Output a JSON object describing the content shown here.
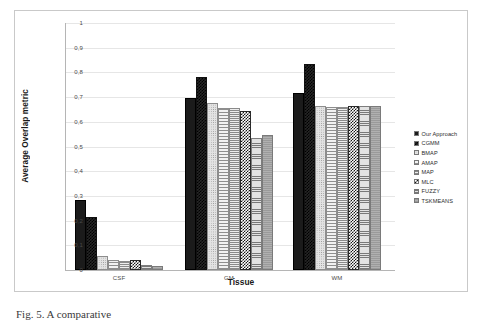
{
  "figure": {
    "caption": "Fig. 5.  A comparative",
    "background_color": "#ffffff",
    "frame_color": "#c9c9c9"
  },
  "chart_data": {
    "type": "bar",
    "title": "",
    "xlabel": "Tissue",
    "ylabel": "Average Overlap metric",
    "categories": [
      "CSF",
      "GM",
      "WM"
    ],
    "ylim": [
      0,
      1
    ],
    "yticks": [
      "0",
      "0,1",
      "0,2",
      "0,3",
      "0,4",
      "0,5",
      "0,6",
      "0,7",
      "0,8",
      "0,9",
      "1"
    ],
    "ytick_values": [
      0,
      0.1,
      0.2,
      0.3,
      0.4,
      0.5,
      0.6,
      0.7,
      0.8,
      0.9,
      1
    ],
    "grid": true,
    "legend_position": "right",
    "series": [
      {
        "name": "Our Approach",
        "pattern": "solid-black",
        "color": "#1b1b1b",
        "values": [
          0.285,
          0.695,
          0.715
        ]
      },
      {
        "name": "CGMM",
        "pattern": "checker-dark",
        "color": "#262626",
        "values": [
          0.215,
          0.78,
          0.835
        ]
      },
      {
        "name": "BMAP",
        "pattern": "dots-light",
        "color": "#e3e3e3",
        "values": [
          0.055,
          0.675,
          0.665
        ]
      },
      {
        "name": "AMAP",
        "pattern": "hlines-sparse",
        "color": "#f2f2f2",
        "values": [
          0.04,
          0.655,
          0.66
        ]
      },
      {
        "name": "MAP",
        "pattern": "hlines-dense",
        "color": "#ededed",
        "values": [
          0.038,
          0.655,
          0.66
        ]
      },
      {
        "name": "MLC",
        "pattern": "checker-bw",
        "color": "#ffffff",
        "values": [
          0.04,
          0.645,
          0.665
        ]
      },
      {
        "name": "FUZZY",
        "pattern": "hlines-gray",
        "color": "#e2e2e2",
        "values": [
          0.02,
          0.535,
          0.665
        ]
      },
      {
        "name": "TSKMEANS",
        "pattern": "solid-gray",
        "color": "#a7a7a7",
        "values": [
          0.015,
          0.545,
          0.665
        ]
      }
    ]
  }
}
